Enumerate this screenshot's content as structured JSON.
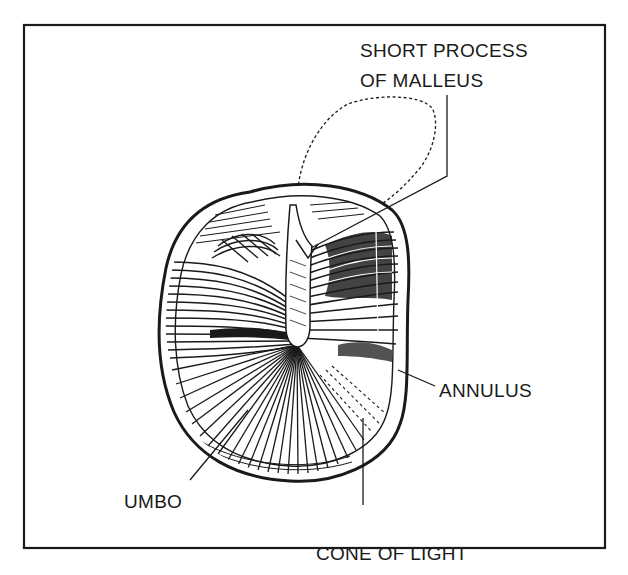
{
  "figure": {
    "colors": {
      "ink": "#1a1a1a",
      "background": "#ffffff"
    }
  },
  "labels": {
    "short_process_line1": "SHORT PROCESS",
    "short_process_line2": "OF MALLEUS",
    "annulus": "ANNULUS",
    "umbo": "UMBO",
    "cone_of_light": "CONE OF LIGHT"
  }
}
